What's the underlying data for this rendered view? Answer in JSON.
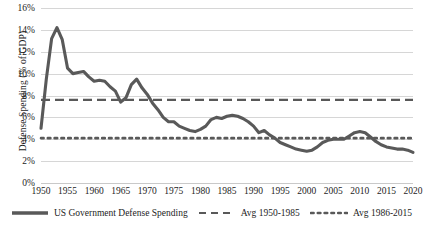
{
  "chart_data": {
    "type": "line",
    "title": "",
    "xlabel": "",
    "ylabel": "Defense Spending (% of GDP)",
    "xlim": [
      1950,
      2020
    ],
    "ylim": [
      0,
      16
    ],
    "ytick_labels": [
      "16%",
      "14%",
      "12%",
      "10%",
      "8%",
      "6%",
      "4%",
      "2%",
      "0%"
    ],
    "ytick_values": [
      16,
      14,
      12,
      10,
      8,
      6,
      4,
      2,
      0
    ],
    "xtick_labels": [
      "1950",
      "1955",
      "1960",
      "1965",
      "1970",
      "1975",
      "1980",
      "1985",
      "1990",
      "1995",
      "2000",
      "2005",
      "2010",
      "2015",
      "2020"
    ],
    "xtick_values": [
      1950,
      1955,
      1960,
      1965,
      1970,
      1975,
      1980,
      1985,
      1990,
      1995,
      2000,
      2005,
      2010,
      2015,
      2020
    ],
    "grid": true,
    "legend_position": "bottom",
    "series": [
      {
        "name": "US Government Defense Spending",
        "style": "solid",
        "color": "#595959",
        "x": [
          1950,
          1951,
          1952,
          1953,
          1954,
          1955,
          1956,
          1957,
          1958,
          1959,
          1960,
          1961,
          1962,
          1963,
          1964,
          1965,
          1966,
          1967,
          1968,
          1969,
          1970,
          1971,
          1972,
          1973,
          1974,
          1975,
          1976,
          1977,
          1978,
          1979,
          1980,
          1981,
          1982,
          1983,
          1984,
          1985,
          1986,
          1987,
          1988,
          1989,
          1990,
          1991,
          1992,
          1993,
          1994,
          1995,
          1996,
          1997,
          1998,
          1999,
          2000,
          2001,
          2002,
          2003,
          2004,
          2005,
          2006,
          2007,
          2008,
          2009,
          2010,
          2011,
          2012,
          2013,
          2014,
          2015,
          2016,
          2017,
          2018,
          2019,
          2020
        ],
        "values": [
          5.0,
          9.5,
          13.2,
          14.2,
          13.1,
          10.5,
          10.0,
          10.1,
          10.2,
          9.7,
          9.3,
          9.4,
          9.3,
          8.8,
          8.4,
          7.4,
          7.8,
          9.0,
          9.5,
          8.7,
          8.1,
          7.3,
          6.7,
          6.0,
          5.6,
          5.6,
          5.2,
          5.0,
          4.8,
          4.7,
          4.9,
          5.2,
          5.8,
          6.0,
          5.9,
          6.1,
          6.2,
          6.1,
          5.9,
          5.6,
          5.2,
          4.6,
          4.8,
          4.4,
          4.1,
          3.7,
          3.5,
          3.3,
          3.1,
          3.0,
          2.9,
          3.0,
          3.3,
          3.7,
          3.9,
          4.0,
          4.0,
          4.0,
          4.3,
          4.6,
          4.7,
          4.6,
          4.2,
          3.8,
          3.5,
          3.3,
          3.2,
          3.1,
          3.1,
          3.0,
          2.8
        ]
      },
      {
        "name": "Avg 1950-1985",
        "style": "dashed",
        "color": "#595959",
        "value": 7.6,
        "x_start": 1950,
        "x_end": 2020
      },
      {
        "name": "Avg 1986-2015",
        "style": "dotted",
        "color": "#595959",
        "value": 4.1,
        "x_start": 1950,
        "x_end": 2020
      }
    ]
  },
  "legend": {
    "items": [
      {
        "label": "US Government Defense Spending",
        "marker": "solid-line-swatch"
      },
      {
        "label": "Avg 1950-1985",
        "marker": "dashed-line-swatch"
      },
      {
        "label": "Avg 1986-2015",
        "marker": "dotted-line-swatch"
      }
    ]
  },
  "colors": {
    "series_line": "#595959",
    "gridline": "#d6d6d6",
    "text": "#1d1d1d",
    "background": "#ffffff"
  }
}
